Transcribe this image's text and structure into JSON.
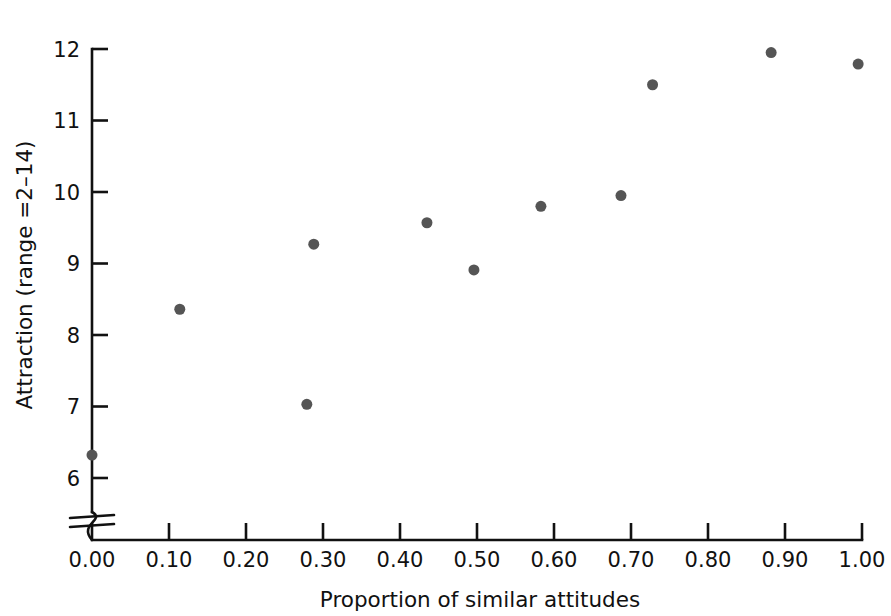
{
  "chart_data": {
    "type": "scatter",
    "title": "",
    "xlabel": "Proportion of similar attitudes",
    "ylabel": "Attraction (range =2–14)",
    "xlim": [
      0.0,
      1.0
    ],
    "ylim": [
      5.7,
      12.0
    ],
    "grid": false,
    "legend": null,
    "x_ticks": [
      "0.00",
      "0.10",
      "0.20",
      "0.30",
      "0.40",
      "0.50",
      "0.60",
      "0.70",
      "0.80",
      "0.90",
      "1.00"
    ],
    "x_tick_values": [
      0.0,
      0.1,
      0.2,
      0.3,
      0.4,
      0.5,
      0.6,
      0.7,
      0.8,
      0.9,
      1.0
    ],
    "y_ticks": [
      "6",
      "7",
      "8",
      "9",
      "10",
      "11",
      "12"
    ],
    "y_tick_values": [
      6,
      7,
      8,
      9,
      10,
      11,
      12
    ],
    "axis_break": {
      "axis": "y",
      "present": true,
      "description": "y-axis broken below 6"
    },
    "marker": {
      "shape": "circle",
      "color": "#555555",
      "size_px": 11
    },
    "points": [
      {
        "x": 0.0,
        "y": 6.32
      },
      {
        "x": 0.114,
        "y": 8.36
      },
      {
        "x": 0.279,
        "y": 7.03
      },
      {
        "x": 0.288,
        "y": 9.27
      },
      {
        "x": 0.435,
        "y": 9.57
      },
      {
        "x": 0.496,
        "y": 8.91
      },
      {
        "x": 0.583,
        "y": 9.8
      },
      {
        "x": 0.687,
        "y": 9.95
      },
      {
        "x": 0.728,
        "y": 11.5
      },
      {
        "x": 0.882,
        "y": 11.95
      },
      {
        "x": 0.995,
        "y": 11.79
      }
    ]
  }
}
